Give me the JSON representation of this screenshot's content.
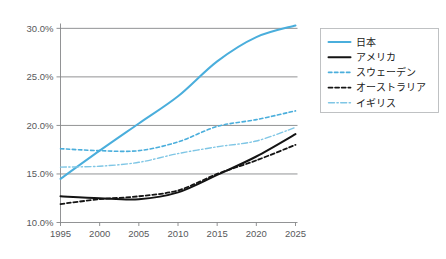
{
  "chart_data": {
    "type": "line",
    "title": "",
    "subtitle": "",
    "xlabel": "",
    "ylabel": "",
    "x": [
      1995,
      2000,
      2005,
      2010,
      2015,
      2020,
      2025
    ],
    "x_tick_labels": [
      "1995",
      "2000",
      "2005",
      "2010",
      "2015",
      "2020",
      "2025"
    ],
    "y_tick_labels": [
      "10.0%",
      "15.0%",
      "20.0%",
      "25.0%",
      "30.0%"
    ],
    "y_tick_values": [
      10.0,
      15.0,
      20.0,
      25.0,
      30.0
    ],
    "ylim": [
      10.0,
      30.5
    ],
    "xlim": [
      1995,
      2025
    ],
    "grid": "horizontal",
    "legend_position": "right",
    "series": [
      {
        "name": "日本",
        "color": "#4aaedc",
        "style": "solid",
        "width": 2.0,
        "values": [
          14.5,
          17.4,
          20.2,
          23.0,
          26.6,
          29.1,
          30.3
        ]
      },
      {
        "name": "アメリカ",
        "color": "#141414",
        "style": "solid",
        "width": 2.0,
        "values": [
          12.7,
          12.5,
          12.4,
          13.1,
          14.9,
          16.8,
          19.1
        ]
      },
      {
        "name": "スウェーデン",
        "color": "#4aaedc",
        "style": "dashed",
        "width": 1.6,
        "values": [
          17.6,
          17.4,
          17.4,
          18.3,
          19.9,
          20.6,
          21.5
        ]
      },
      {
        "name": "オーストラリア",
        "color": "#141414",
        "style": "dashed",
        "width": 1.8,
        "values": [
          11.9,
          12.4,
          12.7,
          13.3,
          15.0,
          16.4,
          18.0
        ]
      },
      {
        "name": "イギリス",
        "color": "#7fc6e5",
        "style": "dashdot",
        "width": 1.4,
        "values": [
          15.7,
          15.8,
          16.2,
          17.1,
          17.8,
          18.4,
          19.8
        ]
      }
    ]
  },
  "legend": {
    "items": [
      {
        "label": "日本"
      },
      {
        "label": "アメリカ"
      },
      {
        "label": "スウェーデン"
      },
      {
        "label": "オーストラリア"
      },
      {
        "label": "イギリス"
      }
    ]
  },
  "axes": {
    "y_labels": [
      "30.0%",
      "25.0%",
      "20.0%",
      "15.0%",
      "10.0%"
    ],
    "x_labels": [
      "1995",
      "2000",
      "2005",
      "2010",
      "2015",
      "2020",
      "2025"
    ]
  },
  "colors": {
    "primary_blue": "#4aaedc",
    "light_blue": "#7fc6e5",
    "black": "#141414",
    "grid_gray": "#868789",
    "legend_border": "#b9bbbd"
  }
}
